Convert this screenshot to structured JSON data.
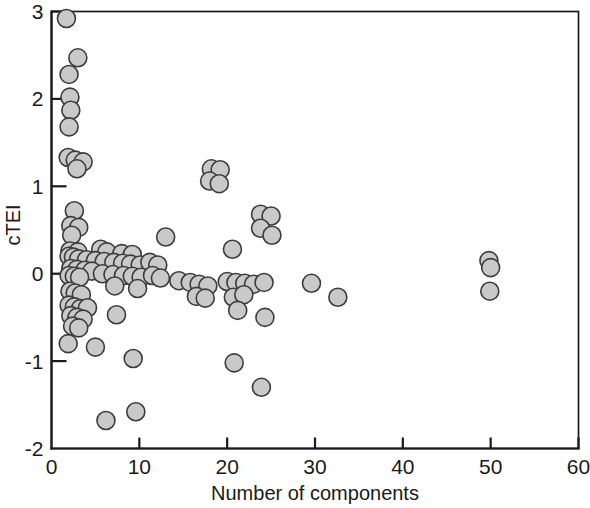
{
  "chart_data": {
    "type": "scatter",
    "title": "",
    "xlabel": "Number of components",
    "ylabel": "cTEI",
    "xlim": [
      0,
      60
    ],
    "ylim": [
      -2,
      3
    ],
    "xticks": [
      0,
      10,
      20,
      30,
      40,
      50,
      60
    ],
    "yticks": [
      -2,
      -1,
      0,
      1,
      2,
      3
    ],
    "xtick_labels": [
      "0",
      "10",
      "20",
      "30",
      "40",
      "50",
      "60"
    ],
    "ytick_labels": [
      "-2",
      "-1",
      "0",
      "1",
      "2",
      "3"
    ],
    "grid": false,
    "legend": null,
    "marker": {
      "shape": "circle",
      "fill_color": "#c9c9c9",
      "edge_color": "#3c3c3c",
      "size_px": 9
    },
    "series": [
      {
        "name": "cTEI vs number of components",
        "points": [
          [
            1.7,
            2.92
          ],
          [
            3.0,
            2.47
          ],
          [
            2.0,
            2.28
          ],
          [
            2.1,
            2.02
          ],
          [
            2.2,
            1.87
          ],
          [
            2.0,
            1.68
          ],
          [
            1.9,
            1.33
          ],
          [
            2.7,
            1.3
          ],
          [
            3.6,
            1.28
          ],
          [
            2.9,
            1.2
          ],
          [
            18.2,
            1.2
          ],
          [
            19.2,
            1.19
          ],
          [
            18.0,
            1.06
          ],
          [
            19.1,
            1.03
          ],
          [
            2.6,
            0.72
          ],
          [
            2.2,
            0.55
          ],
          [
            3.1,
            0.53
          ],
          [
            2.3,
            0.44
          ],
          [
            23.8,
            0.68
          ],
          [
            25.0,
            0.66
          ],
          [
            23.8,
            0.52
          ],
          [
            25.1,
            0.44
          ],
          [
            2.1,
            0.26
          ],
          [
            3.0,
            0.25
          ],
          [
            5.6,
            0.28
          ],
          [
            6.3,
            0.25
          ],
          [
            8.0,
            0.23
          ],
          [
            9.2,
            0.22
          ],
          [
            13.0,
            0.42
          ],
          [
            20.6,
            0.28
          ],
          [
            2.0,
            0.2
          ],
          [
            2.5,
            0.19
          ],
          [
            3.1,
            0.17
          ],
          [
            4.0,
            0.16
          ],
          [
            5.0,
            0.15
          ],
          [
            6.0,
            0.14
          ],
          [
            7.1,
            0.13
          ],
          [
            8.1,
            0.12
          ],
          [
            9.0,
            0.11
          ],
          [
            10.1,
            0.1
          ],
          [
            11.2,
            0.13
          ],
          [
            12.1,
            0.1
          ],
          [
            2.2,
            0.06
          ],
          [
            2.9,
            0.05
          ],
          [
            3.8,
            0.04
          ],
          [
            4.6,
            0.03
          ],
          [
            2.0,
            -0.02
          ],
          [
            2.6,
            -0.03
          ],
          [
            3.2,
            -0.04
          ],
          [
            5.8,
            0.0
          ],
          [
            7.0,
            -0.01
          ],
          [
            8.2,
            -0.02
          ],
          [
            9.2,
            -0.03
          ],
          [
            10.2,
            -0.04
          ],
          [
            11.5,
            -0.02
          ],
          [
            12.4,
            -0.05
          ],
          [
            14.5,
            -0.08
          ],
          [
            15.8,
            -0.1
          ],
          [
            16.8,
            -0.12
          ],
          [
            17.8,
            -0.14
          ],
          [
            20.0,
            -0.09
          ],
          [
            21.0,
            -0.1
          ],
          [
            22.0,
            -0.11
          ],
          [
            23.0,
            -0.12
          ],
          [
            24.2,
            -0.1
          ],
          [
            29.6,
            -0.11
          ],
          [
            32.6,
            -0.27
          ],
          [
            2.1,
            -0.2
          ],
          [
            2.7,
            -0.22
          ],
          [
            3.4,
            -0.24
          ],
          [
            7.2,
            -0.14
          ],
          [
            9.8,
            -0.17
          ],
          [
            16.5,
            -0.26
          ],
          [
            17.5,
            -0.28
          ],
          [
            20.7,
            -0.27
          ],
          [
            21.9,
            -0.24
          ],
          [
            49.8,
            0.15
          ],
          [
            50.0,
            0.07
          ],
          [
            49.9,
            -0.2
          ],
          [
            2.0,
            -0.36
          ],
          [
            2.6,
            -0.38
          ],
          [
            3.3,
            -0.4
          ],
          [
            4.1,
            -0.39
          ],
          [
            2.2,
            -0.48
          ],
          [
            2.9,
            -0.5
          ],
          [
            3.6,
            -0.52
          ],
          [
            7.4,
            -0.47
          ],
          [
            21.2,
            -0.42
          ],
          [
            24.3,
            -0.5
          ],
          [
            2.4,
            -0.6
          ],
          [
            3.1,
            -0.62
          ],
          [
            1.9,
            -0.8
          ],
          [
            5.0,
            -0.84
          ],
          [
            9.3,
            -0.97
          ],
          [
            20.8,
            -1.02
          ],
          [
            23.9,
            -1.3
          ],
          [
            6.2,
            -1.68
          ],
          [
            9.6,
            -1.58
          ]
        ]
      }
    ]
  },
  "axes": {
    "x_axis_name": "Number of components",
    "y_axis_name": "cTEI"
  }
}
